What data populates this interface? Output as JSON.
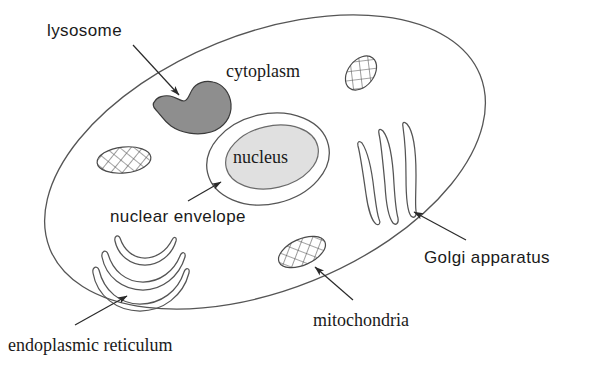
{
  "diagram": {
    "background_color": "#ffffff",
    "ink_color": "#1a1a1a",
    "outline_color": "#555555"
  },
  "labels": [
    {
      "key": "lysosome",
      "text": "lysosome",
      "font_style": "sans",
      "font_size_px": 17,
      "x": 47,
      "y": 22,
      "has_arrow": true
    },
    {
      "key": "cytoplasm",
      "text": "cytoplasm",
      "font_style": "serif",
      "font_size_px": 18,
      "x": 226,
      "y": 62,
      "has_arrow": false
    },
    {
      "key": "nucleus",
      "text": "nucleus",
      "font_style": "serif",
      "font_size_px": 18,
      "x": 233,
      "y": 148,
      "has_arrow": false
    },
    {
      "key": "nuclear-envelope",
      "text": "nuclear envelope",
      "font_style": "sans",
      "font_size_px": 17,
      "x": 110,
      "y": 208,
      "has_arrow": true
    },
    {
      "key": "endoplasmic-reticulum",
      "text": "endoplasmic reticulum",
      "font_style": "serif",
      "font_size_px": 18,
      "x": 8,
      "y": 336,
      "has_arrow": true
    },
    {
      "key": "mitochondria",
      "text": "mitochondria",
      "font_style": "serif",
      "font_size_px": 18,
      "x": 313,
      "y": 311,
      "has_arrow": true
    },
    {
      "key": "golgi-apparatus",
      "text": "Golgi apparatus",
      "font_style": "sans",
      "font_size_px": 17,
      "x": 424,
      "y": 249,
      "has_arrow": true
    }
  ],
  "organelles": {
    "cell_membrane": {
      "name": "cell membrane",
      "shape": "tilted ellipse",
      "center": [
        265,
        162
      ],
      "radii": [
        232,
        128
      ],
      "rotation_deg": -22,
      "fill": "none",
      "stroke": "#555555"
    },
    "lysosome": {
      "name": "lysosome",
      "shape": "irregular notched blob",
      "fill": "#8e8e8e",
      "stroke": "#3a3a3a",
      "center": [
        183,
        106
      ]
    },
    "nucleus": {
      "name": "nucleus",
      "shape": "ellipse",
      "fill": "#e0e0e0",
      "stroke": "#555555",
      "center": [
        272,
        157
      ],
      "radii": [
        47,
        31
      ],
      "rotation_deg": -13
    },
    "nuclear_envelope": {
      "name": "nuclear envelope",
      "shape": "ellipse outline",
      "fill": "none",
      "stroke": "#555555",
      "center": [
        268,
        159
      ],
      "radii": [
        62,
        45
      ],
      "rotation_deg": -13
    },
    "mitochondria": {
      "name": "mitochondria",
      "count": 3,
      "shape": "cross-hatched ellipse",
      "fill": "cross-hatch pattern",
      "stroke": "#4a4a4a",
      "positions": [
        {
          "center": [
            124,
            160
          ],
          "radii": [
            27,
            13
          ],
          "rotation_deg": -6
        },
        {
          "center": [
            361,
            73
          ],
          "radii": [
            19,
            13
          ],
          "rotation_deg": -52
        },
        {
          "center": [
            302,
            252
          ],
          "radii": [
            25,
            13
          ],
          "rotation_deg": -24
        }
      ]
    },
    "golgi_apparatus": {
      "name": "Golgi apparatus",
      "count": 3,
      "shape": "elongated curved sacs",
      "fill": "none",
      "stroke": "#555555"
    },
    "endoplasmic_reticulum": {
      "name": "endoplasmic reticulum",
      "count": 3,
      "shape": "nested crescent arcs",
      "fill": "none",
      "stroke": "#555555"
    }
  },
  "arrows": [
    {
      "key": "arrow-lysosome",
      "from": [
        133,
        45
      ],
      "to": [
        181,
        97
      ]
    },
    {
      "key": "arrow-nuclear-envelope",
      "from": [
        188,
        201
      ],
      "to": [
        222,
        181
      ]
    },
    {
      "key": "arrow-endoplasmic-reticulum",
      "from": [
        75,
        325
      ],
      "to": [
        128,
        295
      ]
    },
    {
      "key": "arrow-mitochondria",
      "from": [
        353,
        300
      ],
      "to": [
        314,
        266
      ]
    },
    {
      "key": "arrow-golgi-apparatus",
      "from": [
        466,
        240
      ],
      "to": [
        413,
        211
      ]
    }
  ]
}
